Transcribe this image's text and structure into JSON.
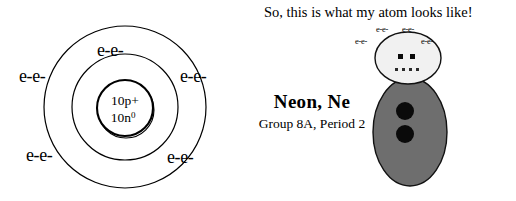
{
  "bohr_model": {
    "nucleus": {
      "protons": "10p+",
      "neutrons_base": "10n",
      "neutrons_sup": "0"
    },
    "shell_labels": [
      {
        "text": "e-e-",
        "position": "inner-shell-top"
      },
      {
        "text": "e-e-",
        "position": "outer-shell-left"
      },
      {
        "text": "e-e-",
        "position": "outer-shell-right"
      },
      {
        "text": "e-e-",
        "position": "outer-shell-bottom-left"
      },
      {
        "text": "e-e-",
        "position": "outer-shell-bottom-right"
      }
    ],
    "ring_count": 3
  },
  "character": {
    "speech": "So, this is what my atom looks like!",
    "element_name": "Neon, Ne",
    "element_group": "Group 8A, Period 2",
    "head_electron_labels": [
      {
        "text": "e-e-",
        "position": "head-top-left"
      },
      {
        "text": "e-e-",
        "position": "head-top-right"
      },
      {
        "text": "e-e-",
        "position": "head-side-left"
      },
      {
        "text": "e-e-",
        "position": "head-side-right"
      }
    ],
    "colors": {
      "body": "#6e6e6e",
      "head": "#f1f1f1",
      "outline": "#111111",
      "dots": "#0a0a0a"
    }
  }
}
